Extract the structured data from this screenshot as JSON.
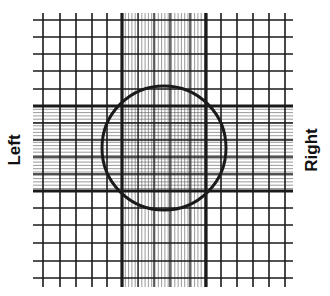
{
  "labels": {
    "left": "Left",
    "right": "Right"
  },
  "colors": {
    "background": "#ffffff",
    "line": "#1a1a1a",
    "thin_line": "#555555"
  },
  "grid": {
    "x_min": 33,
    "x_max": 293,
    "y_min": 13,
    "y_max": 287,
    "heavy_vertical": [
      122,
      206
    ],
    "heavy_horizontal": [
      106,
      191
    ],
    "regular_vertical": [
      43,
      60,
      76,
      92,
      107,
      221,
      237,
      253,
      269,
      285
    ],
    "regular_horizontal": [
      20,
      37,
      54,
      71,
      89,
      208,
      225,
      243,
      261,
      278
    ],
    "medium_vertical_band": [
      138,
      154,
      170,
      190
    ],
    "medium_horizontal_band": [
      123,
      140,
      157,
      174
    ],
    "fine_spacing": 3.3
  },
  "circle": {
    "cx": 164,
    "cy": 148,
    "r": 62
  }
}
